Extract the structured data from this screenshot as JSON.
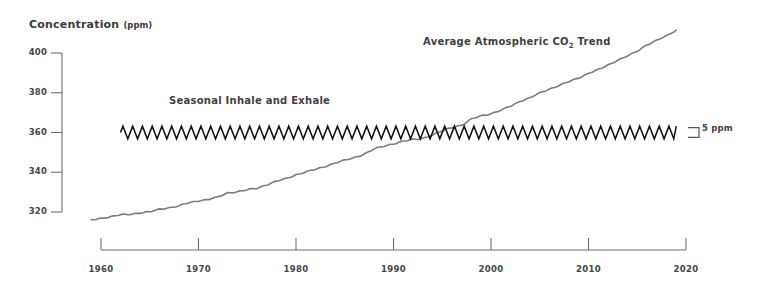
{
  "axis_title": {
    "text": "Concentration",
    "unit": "(ppm)"
  },
  "annotations": {
    "trend_prefix": "Average Atmospheric CO",
    "trend_sub": "2",
    "trend_suffix": " Trend",
    "seasonal": "Seasonal Inhale and Exhale",
    "scale_bar": "5 ppm"
  },
  "colors": {
    "axis": "#6e6e76",
    "trend_line": "#7b7b83",
    "seasonal_line": "#111111",
    "tick_text": "#44444c",
    "title_text": "#3a3a42",
    "background": "#ffffff"
  },
  "chart_data": {
    "type": "line",
    "title": "",
    "xlabel": "",
    "ylabel": "Concentration (ppm)",
    "xlim": [
      1959,
      2020
    ],
    "ylim": [
      313,
      404
    ],
    "yticks": [
      320,
      340,
      360,
      380,
      400
    ],
    "xticks": [
      1960,
      1970,
      1980,
      1990,
      2000,
      2010,
      2020
    ],
    "grid": false,
    "legend": "none",
    "series": [
      {
        "name": "Average Atmospheric CO2 Trend",
        "style": "smooth-line",
        "color": "#7b7b83",
        "x": [
          1959,
          1960,
          1961,
          1962,
          1963,
          1964,
          1965,
          1966,
          1967,
          1968,
          1969,
          1970,
          1971,
          1972,
          1973,
          1974,
          1975,
          1976,
          1977,
          1978,
          1979,
          1980,
          1981,
          1982,
          1983,
          1984,
          1985,
          1986,
          1987,
          1988,
          1989,
          1990,
          1991,
          1992,
          1993,
          1994,
          1995,
          1996,
          1997,
          1998,
          1999,
          2000,
          2001,
          2002,
          2003,
          2004,
          2005,
          2006,
          2007,
          2008,
          2009,
          2010,
          2011,
          2012,
          2013,
          2014,
          2015,
          2016,
          2017,
          2018,
          2019
        ],
        "values": [
          316.0,
          316.9,
          317.6,
          318.5,
          318.9,
          319.6,
          320.0,
          321.4,
          322.2,
          323.0,
          324.6,
          325.7,
          326.3,
          327.5,
          329.7,
          330.2,
          331.1,
          332.0,
          333.8,
          335.4,
          336.8,
          338.8,
          340.1,
          341.4,
          343.0,
          344.6,
          346.0,
          347.4,
          349.2,
          351.6,
          353.1,
          354.4,
          355.6,
          356.4,
          357.1,
          358.8,
          360.8,
          362.6,
          363.7,
          366.7,
          368.4,
          369.5,
          371.1,
          373.2,
          375.8,
          377.5,
          379.8,
          381.9,
          383.8,
          385.6,
          387.4,
          389.9,
          391.6,
          393.8,
          396.5,
          398.6,
          400.8,
          404.2,
          406.5,
          408.5,
          411.4
        ]
      },
      {
        "name": "Seasonal Inhale and Exhale",
        "style": "sawtooth-oscillation",
        "color": "#111111",
        "center_ppm": 360,
        "amplitude_ppm": 3.2,
        "period_years": 1,
        "x_start": 1962,
        "x_end": 2019
      }
    ],
    "scale_bar": {
      "label": "5 ppm",
      "value": 5,
      "units": "ppm",
      "center_ppm": 360
    }
  }
}
